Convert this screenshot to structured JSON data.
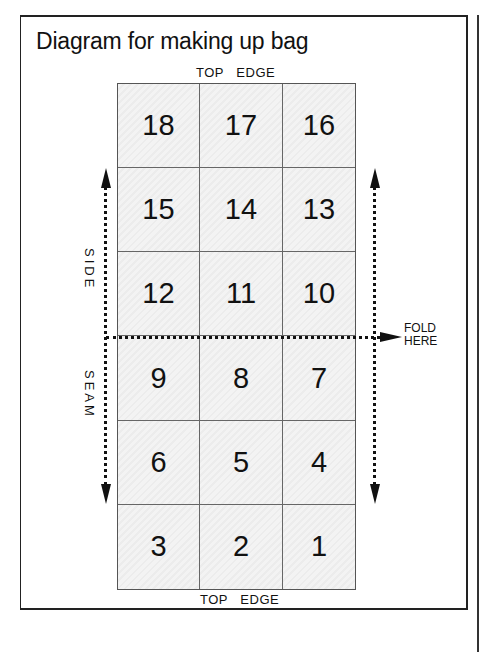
{
  "title": "Diagram for making up bag",
  "top_edge_label_top": {
    "word1": "TOP",
    "word2": "EDGE"
  },
  "top_edge_label_bottom": {
    "word1": "TOP",
    "word2": "EDGE"
  },
  "side_labels": {
    "upper": "SIDE",
    "lower": "SEAM"
  },
  "fold_label": {
    "line1": "FOLD",
    "line2": "HERE"
  },
  "grid": {
    "columns": 3,
    "rows": [
      [
        "18",
        "17",
        "16"
      ],
      [
        "15",
        "14",
        "13"
      ],
      [
        "12",
        "11",
        "10"
      ],
      [
        "9",
        "8",
        "7"
      ],
      [
        "6",
        "5",
        "4"
      ],
      [
        "3",
        "2",
        "1"
      ]
    ]
  },
  "colors": {
    "cell_fill": "#f1f1f1",
    "line": "#111111",
    "grid_line": "#666666"
  }
}
